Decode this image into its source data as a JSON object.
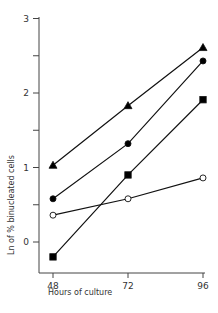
{
  "chart_data": {
    "type": "line",
    "title": "",
    "xlabel": "Hours of culture",
    "ylabel": "Ln of % binucleated cells",
    "x": [
      48,
      72,
      96
    ],
    "xticks": [
      "48",
      "72",
      "96"
    ],
    "yticks": [
      "0",
      "1",
      "2",
      "3"
    ],
    "ylim": [
      -0.4,
      3
    ],
    "xlim": [
      48,
      96
    ],
    "grid": false,
    "legend": "none",
    "series": [
      {
        "name": "filled-triangle",
        "marker": "triangle",
        "fill": "#000000",
        "values": [
          1.03,
          1.83,
          2.61
        ]
      },
      {
        "name": "filled-circle",
        "marker": "circle",
        "fill": "#000000",
        "values": [
          0.58,
          1.32,
          2.43
        ]
      },
      {
        "name": "filled-square",
        "marker": "square",
        "fill": "#000000",
        "values": [
          -0.2,
          0.9,
          1.91
        ]
      },
      {
        "name": "open-circle",
        "marker": "circle",
        "fill": "#ffffff",
        "values": [
          0.36,
          0.58,
          0.86
        ]
      }
    ]
  }
}
